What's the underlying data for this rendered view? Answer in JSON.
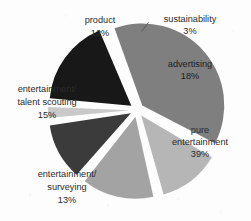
{
  "chart_data": {
    "type": "pie",
    "title": "",
    "legend_position": "none",
    "exploded": true,
    "labels": [
      "sustainability",
      "advertising",
      "pure entertainment",
      "entertainment/ surveying",
      "entertainment/ talent scouting",
      "product"
    ],
    "values": [
      3,
      18,
      39,
      13,
      15,
      12
    ],
    "value_unit": "%",
    "colors": [
      "#c9c9c9",
      "#181818",
      "#7f7f7f",
      "#b6b6b6",
      "#a3a3a3",
      "#3b3b3b"
    ],
    "slices": [
      {
        "name": "sustainability",
        "value": 3,
        "value_text": "3%",
        "color": "#c9c9c9",
        "label_line1": "sustainability",
        "label_line2": "3%",
        "label_placement": "outside",
        "has_leader_line": true
      },
      {
        "name": "advertising",
        "value": 18,
        "value_text": "18%",
        "color": "#181818",
        "label_line1": "advertising",
        "label_line2": "18%",
        "label_placement": "inside",
        "has_leader_line": false
      },
      {
        "name": "pure entertainment",
        "value": 39,
        "value_text": "39%",
        "color": "#7f7f7f",
        "label_line1": "pure",
        "label_line2": "entertainment",
        "label_line3": "39%",
        "label_placement": "inside",
        "has_leader_line": false
      },
      {
        "name": "entertainment/ surveying",
        "value": 13,
        "value_text": "13%",
        "color": "#b6b6b6",
        "label_line1": "entertainment/",
        "label_line2": "surveying",
        "label_line3": "13%",
        "label_placement": "outside",
        "has_leader_line": false
      },
      {
        "name": "entertainment/ talent scouting",
        "value": 15,
        "value_text": "15%",
        "color": "#a3a3a3",
        "label_line1": "entertainment/",
        "label_line2": "talent scouting",
        "label_line3": "15%",
        "label_placement": "outside",
        "has_leader_line": false
      },
      {
        "name": "product",
        "value": 12,
        "value_text": "12%",
        "color": "#3b3b3b",
        "label_line1": "product",
        "label_line2": "12%",
        "label_placement": "outside",
        "has_leader_line": false
      }
    ]
  },
  "background_color": "#fdfdfd"
}
